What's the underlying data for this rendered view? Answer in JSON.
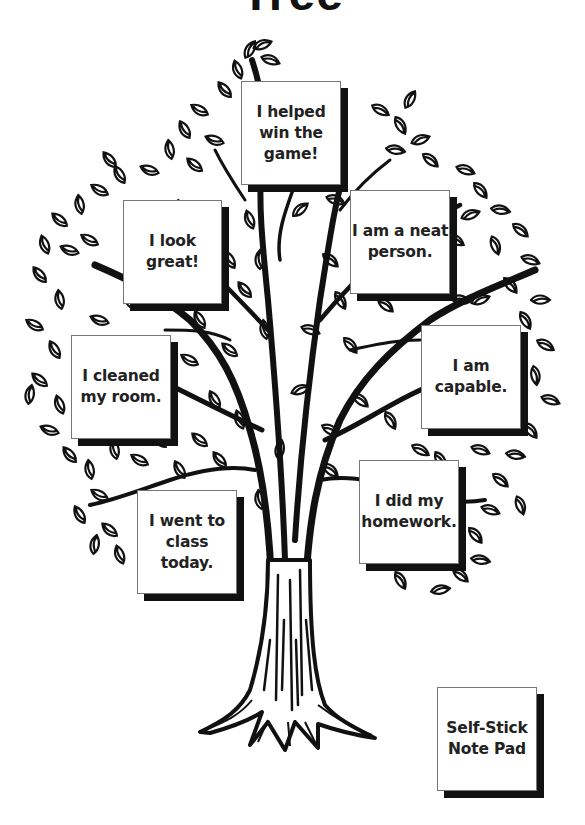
{
  "title": "Tree",
  "notes": [
    {
      "id": "helped-win",
      "text": "I helped\nwin the\ngame!",
      "x": 241,
      "y": 81,
      "w": 100,
      "h": 104
    },
    {
      "id": "look-great",
      "text": "I look\ngreat!",
      "x": 123,
      "y": 200,
      "w": 99,
      "h": 104
    },
    {
      "id": "neat-person",
      "text": "I am a neat\nperson.",
      "x": 350,
      "y": 190,
      "w": 100,
      "h": 104
    },
    {
      "id": "cleaned-room",
      "text": "I cleaned\nmy room.",
      "x": 71,
      "y": 335,
      "w": 100,
      "h": 104
    },
    {
      "id": "capable",
      "text": "I am\ncapable.",
      "x": 421,
      "y": 325,
      "w": 100,
      "h": 104
    },
    {
      "id": "homework",
      "text": "I did my\nhomework.",
      "x": 359,
      "y": 460,
      "w": 100,
      "h": 104
    },
    {
      "id": "went-to-class",
      "text": "I went to\nclass today.",
      "x": 137,
      "y": 490,
      "w": 100,
      "h": 104
    }
  ],
  "legend_pad": {
    "text": "Self-Stick\nNote Pad",
    "x": 437,
    "y": 687,
    "w": 100,
    "h": 104
  },
  "colors": {
    "ink": "#111111",
    "paper": "#ffffff",
    "note_border": "#777777",
    "shadow": "#111111"
  },
  "leaves": [
    [
      250,
      50,
      -60
    ],
    [
      262,
      45,
      -20
    ],
    [
      238,
      70,
      -110
    ],
    [
      270,
      60,
      20
    ],
    [
      280,
      95,
      -40
    ],
    [
      225,
      90,
      -130
    ],
    [
      380,
      110,
      30
    ],
    [
      400,
      125,
      60
    ],
    [
      420,
      140,
      -20
    ],
    [
      395,
      150,
      10
    ],
    [
      430,
      160,
      40
    ],
    [
      410,
      100,
      -60
    ],
    [
      200,
      110,
      -150
    ],
    [
      185,
      130,
      -120
    ],
    [
      215,
      140,
      -160
    ],
    [
      170,
      150,
      -100
    ],
    [
      195,
      165,
      -140
    ],
    [
      150,
      170,
      -160
    ],
    [
      120,
      175,
      -120
    ],
    [
      100,
      190,
      -150
    ],
    [
      80,
      205,
      -100
    ],
    [
      110,
      160,
      -130
    ],
    [
      60,
      220,
      -140
    ],
    [
      45,
      245,
      -110
    ],
    [
      70,
      250,
      -160
    ],
    [
      40,
      275,
      -130
    ],
    [
      60,
      300,
      -100
    ],
    [
      35,
      325,
      -150
    ],
    [
      55,
      350,
      -120
    ],
    [
      40,
      380,
      -140
    ],
    [
      60,
      405,
      -110
    ],
    [
      30,
      395,
      -80
    ],
    [
      50,
      430,
      -160
    ],
    [
      70,
      455,
      -130
    ],
    [
      90,
      470,
      -100
    ],
    [
      100,
      495,
      -150
    ],
    [
      80,
      515,
      -120
    ],
    [
      110,
      530,
      -140
    ],
    [
      120,
      555,
      -110
    ],
    [
      95,
      545,
      -80
    ],
    [
      465,
      170,
      20
    ],
    [
      480,
      190,
      50
    ],
    [
      500,
      210,
      10
    ],
    [
      470,
      215,
      -20
    ],
    [
      520,
      230,
      40
    ],
    [
      495,
      245,
      70
    ],
    [
      530,
      260,
      20
    ],
    [
      510,
      285,
      50
    ],
    [
      540,
      300,
      0
    ],
    [
      525,
      320,
      60
    ],
    [
      545,
      345,
      30
    ],
    [
      535,
      375,
      80
    ],
    [
      550,
      400,
      20
    ],
    [
      530,
      430,
      50
    ],
    [
      515,
      455,
      10
    ],
    [
      500,
      480,
      40
    ],
    [
      520,
      505,
      70
    ],
    [
      490,
      510,
      20
    ],
    [
      475,
      535,
      50
    ],
    [
      480,
      560,
      10
    ],
    [
      460,
      575,
      40
    ],
    [
      400,
      580,
      60
    ],
    [
      420,
      565,
      20
    ],
    [
      440,
      590,
      -10
    ],
    [
      300,
      150,
      -20
    ],
    [
      320,
      170,
      30
    ],
    [
      280,
      180,
      -60
    ],
    [
      335,
      200,
      20
    ],
    [
      300,
      210,
      -40
    ],
    [
      250,
      220,
      -110
    ],
    [
      260,
      260,
      -90
    ],
    [
      245,
      290,
      -130
    ],
    [
      330,
      260,
      40
    ],
    [
      340,
      300,
      60
    ],
    [
      310,
      330,
      20
    ],
    [
      350,
      345,
      50
    ],
    [
      265,
      330,
      -100
    ],
    [
      230,
      350,
      -140
    ],
    [
      200,
      320,
      -120
    ],
    [
      190,
      360,
      -150
    ],
    [
      215,
      400,
      -120
    ],
    [
      360,
      400,
      40
    ],
    [
      390,
      420,
      60
    ],
    [
      330,
      430,
      30
    ],
    [
      240,
      420,
      -110
    ],
    [
      200,
      440,
      -140
    ],
    [
      180,
      470,
      -120
    ],
    [
      300,
      390,
      -20
    ],
    [
      280,
      450,
      -80
    ],
    [
      330,
      470,
      40
    ],
    [
      220,
      460,
      -130
    ],
    [
      370,
      520,
      50
    ],
    [
      260,
      500,
      -100
    ],
    [
      455,
      240,
      30
    ],
    [
      440,
      270,
      60
    ],
    [
      460,
      300,
      10
    ],
    [
      385,
      305,
      40
    ],
    [
      405,
      290,
      70
    ],
    [
      480,
      300,
      -20
    ],
    [
      150,
      220,
      -130
    ],
    [
      90,
      240,
      -150
    ],
    [
      130,
      300,
      -110
    ],
    [
      100,
      320,
      -160
    ],
    [
      180,
      210,
      -100
    ],
    [
      190,
      250,
      -140
    ],
    [
      230,
      260,
      -120
    ],
    [
      215,
      300,
      -150
    ],
    [
      470,
      420,
      40
    ],
    [
      480,
      450,
      20
    ],
    [
      440,
      460,
      60
    ],
    [
      420,
      450,
      30
    ],
    [
      160,
      440,
      -130
    ],
    [
      170,
      420,
      -110
    ],
    [
      140,
      460,
      -150
    ],
    [
      115,
      450,
      -100
    ]
  ]
}
